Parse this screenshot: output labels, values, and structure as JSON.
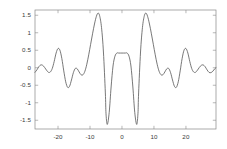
{
  "chart_data": {
    "type": "line",
    "title": "",
    "subtitle": "",
    "xlabel": "",
    "ylabel": "",
    "xlim": [
      -27.2,
      29.4
    ],
    "ylim": [
      -1.75,
      1.65
    ],
    "grid": false,
    "legend": false,
    "legend_position": "none",
    "frame": true,
    "line_color": "#555555",
    "background_color": "#ffffff",
    "axis_color": "#888888",
    "tick_label_color": "#3a3a3a",
    "xticks": [
      -20,
      -10,
      0,
      10,
      20
    ],
    "xtick_labels": [
      "-20",
      "-10",
      "0",
      "10",
      "20"
    ],
    "yticks": [
      -1.5,
      -1,
      -0.5,
      0,
      0.5,
      1,
      1.5
    ],
    "ytick_labels": [
      "-1.5",
      "-1",
      "-0.5",
      "0",
      "0.5",
      "1",
      "1.5"
    ],
    "series": [
      {
        "name": "waveform",
        "x": [
          -27.2,
          -26.6,
          -26.0,
          -25.4,
          -24.8,
          -24.2,
          -23.6,
          -23.0,
          -22.4,
          -21.8,
          -21.2,
          -20.6,
          -20.0,
          -19.4,
          -18.8,
          -18.2,
          -17.6,
          -17.0,
          -16.4,
          -15.8,
          -15.2,
          -14.6,
          -14.0,
          -13.4,
          -12.8,
          -12.2,
          -11.6,
          -11.0,
          -10.4,
          -9.8,
          -9.2,
          -8.6,
          -8.0,
          -7.5,
          -7.0,
          -6.4,
          -5.8,
          -5.2,
          -5.0,
          -4.6,
          -4.0,
          -3.4,
          -2.8,
          -2.2,
          -1.6,
          -1.0,
          -0.5,
          0.0,
          0.5,
          1.0,
          1.6,
          2.2,
          2.8,
          3.4,
          4.0,
          4.6,
          5.0,
          5.2,
          5.8,
          6.4,
          7.0,
          7.5,
          8.0,
          8.6,
          9.2,
          9.8,
          10.4,
          11.0,
          11.6,
          12.2,
          12.8,
          13.4,
          14.0,
          14.6,
          15.2,
          15.8,
          16.4,
          17.0,
          17.6,
          18.2,
          18.8,
          19.4,
          20.0,
          20.6,
          21.2,
          21.8,
          22.4,
          23.0,
          23.6,
          24.2,
          24.8,
          25.4,
          26.0,
          26.6,
          27.2,
          27.8,
          28.4,
          29.0,
          29.4
        ],
        "y": [
          -0.13,
          -0.06,
          0.03,
          0.08,
          0.07,
          0.01,
          -0.07,
          -0.13,
          -0.12,
          -0.02,
          0.18,
          0.42,
          0.55,
          0.5,
          0.26,
          -0.09,
          -0.4,
          -0.56,
          -0.53,
          -0.35,
          -0.14,
          -0.02,
          -0.03,
          -0.12,
          -0.2,
          -0.2,
          -0.1,
          0.1,
          0.37,
          0.67,
          0.97,
          1.25,
          1.47,
          1.56,
          1.49,
          1.15,
          0.45,
          -0.72,
          -1.3,
          -1.62,
          -1.28,
          -0.55,
          0.05,
          0.33,
          0.42,
          0.42,
          0.42,
          0.42,
          0.42,
          0.42,
          0.42,
          0.33,
          0.05,
          -0.55,
          -1.28,
          -1.62,
          -1.3,
          -0.72,
          0.45,
          1.15,
          1.49,
          1.56,
          1.47,
          1.25,
          0.97,
          0.67,
          0.37,
          0.1,
          -0.1,
          -0.2,
          -0.2,
          -0.12,
          -0.03,
          -0.02,
          -0.14,
          -0.35,
          -0.53,
          -0.56,
          -0.4,
          -0.09,
          0.26,
          0.5,
          0.55,
          0.42,
          0.18,
          -0.02,
          -0.12,
          -0.13,
          -0.07,
          0.01,
          0.07,
          0.08,
          0.03,
          -0.06,
          -0.13,
          -0.14,
          -0.1,
          -0.03,
          0.0
        ],
        "style": "solid",
        "width": 0.8
      }
    ],
    "annotations": []
  }
}
